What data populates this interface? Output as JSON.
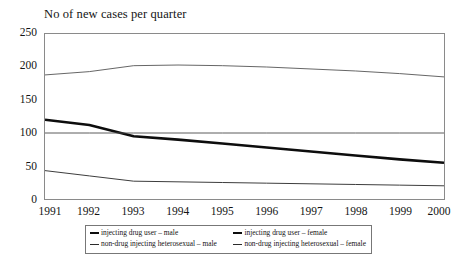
{
  "chart_data": {
    "type": "line",
    "title": "No of new cases per quarter",
    "xlabel": "",
    "ylabel": "",
    "categories": [
      "1991",
      "1992",
      "1993",
      "1994",
      "1995",
      "1996",
      "1997",
      "1998",
      "1999",
      "2000"
    ],
    "x": [
      1991,
      1992,
      1993,
      1994,
      1995,
      1996,
      1997,
      1998,
      1999,
      2000
    ],
    "xlim": [
      1991,
      2000
    ],
    "ylim": [
      0,
      250
    ],
    "yticks": [
      0,
      50,
      100,
      150,
      200,
      250
    ],
    "grid": false,
    "legend_position": "below-axis",
    "series": [
      {
        "name": "injecting drug user – female",
        "values": [
          188,
          193,
          202,
          203,
          202,
          200,
          197,
          194,
          190,
          185
        ],
        "color": "#555555",
        "width": 0.9
      },
      {
        "name": "injecting drug user – male",
        "values": [
          120,
          112,
          95,
          90,
          84,
          78,
          72,
          66,
          60,
          55
        ],
        "color": "#0d0d0d",
        "width": 2.6
      },
      {
        "name": "non-drug injecting heterosexual – female",
        "values": [
          100,
          100,
          100,
          100,
          100,
          100,
          100,
          100,
          100,
          100
        ],
        "color": "#4a4a4a",
        "width": 0.9
      },
      {
        "name": "non-drug injecting heterosexual – male",
        "values": [
          43,
          35,
          27,
          26,
          25,
          24,
          23,
          22,
          21,
          20
        ],
        "color": "#3d3d3d",
        "width": 1.0
      }
    ]
  },
  "axis": {
    "y_tick_labels": [
      "250",
      "200",
      "150",
      "100",
      "50",
      "0"
    ],
    "x_tick_labels": [
      "1991",
      "1992",
      "1993",
      "1994",
      "1995",
      "1996",
      "1997",
      "1998",
      "1999",
      "2000"
    ]
  },
  "legend": {
    "rows": [
      {
        "left": {
          "label": "injecting drug user – male",
          "color": "#0d0d0d",
          "width": 2.4
        },
        "right": {
          "label": "injecting drug user – female",
          "color": "#0d0d0d",
          "width": 2.4
        }
      },
      {
        "left": {
          "label": "non-drug injecting heterosexual – male",
          "color": "#2b2b2b",
          "width": 1.1
        },
        "right": {
          "label": "non-drug injecting heterosexual – female",
          "color": "#2b2b2b",
          "width": 1.1
        }
      }
    ]
  },
  "style": {
    "frame_color": "#8a8a8a",
    "text_color": "#141414",
    "background": "#ffffff"
  }
}
